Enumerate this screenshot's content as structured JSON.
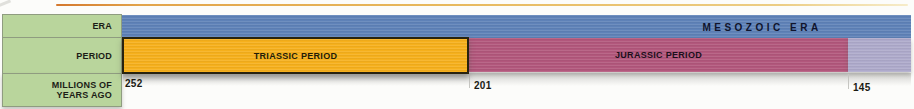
{
  "accent_line": {
    "color_left": "#d4782e",
    "color_right": "#f6ecca"
  },
  "row_labels": {
    "era": "ERA",
    "period": "PERIOD",
    "mya_line1": "MILLIONS OF",
    "mya_line2": "YEARS AGO",
    "cell_color": "#b9d59c"
  },
  "timeline": {
    "era_bar": {
      "label": "MESOZOIC ERA",
      "color": "#5f82b8"
    },
    "periods": [
      {
        "id": "triassic",
        "label": "TRIASSIC PERIOD",
        "color": "#f6b01c",
        "start_mya": "252",
        "end_mya": "201",
        "highlighted": true
      },
      {
        "id": "jurassic",
        "label": "JURASSIC PERIOD",
        "color": "#b2577c",
        "start_mya": "201",
        "end_mya": "145",
        "highlighted": false
      },
      {
        "id": "next-period",
        "label": "",
        "color": "#aeaacb",
        "start_mya": "145",
        "end_mya": "",
        "highlighted": false
      }
    ],
    "axis_values": {
      "v252": "252",
      "v201": "201",
      "v145": "145"
    }
  }
}
